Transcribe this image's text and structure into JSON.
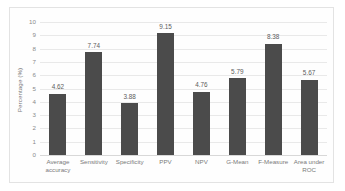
{
  "chart_data": {
    "type": "bar",
    "title": "",
    "xlabel": "",
    "ylabel": "Percentage (%)",
    "ylim": [
      0,
      10
    ],
    "ytick_labels": [
      "10",
      "9",
      "8",
      "7",
      "6",
      "5",
      "4",
      "3",
      "2",
      "1",
      "0"
    ],
    "grid": true,
    "legend": null,
    "bar_color": "#4b4b4b",
    "gridline_color": "#e9e9e9",
    "categories": [
      "Average accuracy",
      "Sensitivity",
      "Specificity",
      "PPV",
      "NPV",
      "G-Mean",
      "F-Measure",
      "Area under ROC"
    ],
    "values": [
      4.62,
      7.74,
      3.88,
      9.15,
      4.76,
      5.79,
      8.38,
      5.67
    ],
    "value_labels": [
      "4.62",
      "7.74",
      "3.88",
      "9.15",
      "4.76",
      "5.79",
      "8.38",
      "5.67"
    ]
  }
}
